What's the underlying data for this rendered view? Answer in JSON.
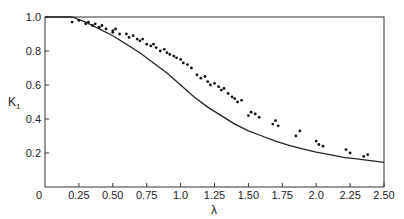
{
  "chart_data": {
    "type": "scatter",
    "title": "",
    "xlabel": "λ",
    "ylabel": "K1",
    "xlim": [
      0,
      2.5
    ],
    "ylim": [
      0,
      1.0
    ],
    "x_ticks": [
      0.25,
      0.5,
      0.75,
      1.0,
      1.25,
      1.5,
      1.75,
      2.0,
      2.25,
      2.5
    ],
    "x_tick_labels": [
      "0.25",
      "0.50",
      "0.75",
      "1.0",
      "1.25",
      "1.50",
      "1.75",
      "2.0",
      "2.25",
      "2.50"
    ],
    "x_origin_label": "0",
    "y_ticks": [
      0.2,
      0.4,
      0.6,
      0.8,
      1.0
    ],
    "y_tick_labels": [
      "0.2",
      "0.4",
      "0.6",
      "0.8",
      "1.0"
    ],
    "grid": false,
    "series": [
      {
        "name": "theory",
        "kind": "line",
        "x": [
          0,
          0.2,
          0.3,
          0.4,
          0.5,
          0.6,
          0.7,
          0.8,
          0.9,
          1.0,
          1.1,
          1.2,
          1.3,
          1.4,
          1.5,
          1.6,
          1.7,
          1.8,
          1.9,
          2.0,
          2.1,
          2.2,
          2.3,
          2.4,
          2.5
        ],
        "y": [
          1.0,
          1.0,
          0.97,
          0.93,
          0.89,
          0.84,
          0.79,
          0.73,
          0.67,
          0.6,
          0.53,
          0.47,
          0.42,
          0.37,
          0.33,
          0.3,
          0.27,
          0.245,
          0.225,
          0.205,
          0.19,
          0.175,
          0.165,
          0.155,
          0.145
        ]
      },
      {
        "name": "measured",
        "kind": "points",
        "x": [
          0.2,
          0.25,
          0.3,
          0.32,
          0.35,
          0.37,
          0.4,
          0.42,
          0.45,
          0.5,
          0.52,
          0.5,
          0.55,
          0.6,
          0.62,
          0.65,
          0.68,
          0.7,
          0.72,
          0.75,
          0.78,
          0.8,
          0.82,
          0.85,
          0.88,
          0.9,
          0.92,
          0.95,
          0.97,
          1.0,
          1.02,
          1.05,
          1.08,
          1.12,
          1.15,
          1.18,
          1.2,
          1.22,
          1.25,
          1.28,
          1.3,
          1.32,
          1.35,
          1.38,
          1.4,
          1.42,
          1.45,
          1.5,
          1.52,
          1.55,
          1.58,
          1.68,
          1.7,
          1.72,
          1.85,
          1.88,
          2.0,
          2.02,
          2.05,
          2.22,
          2.25,
          2.35,
          2.38
        ],
        "y": [
          0.97,
          0.98,
          0.96,
          0.97,
          0.95,
          0.96,
          0.94,
          0.95,
          0.93,
          0.92,
          0.93,
          0.91,
          0.9,
          0.9,
          0.88,
          0.89,
          0.87,
          0.86,
          0.87,
          0.84,
          0.83,
          0.84,
          0.82,
          0.8,
          0.81,
          0.79,
          0.78,
          0.77,
          0.76,
          0.75,
          0.73,
          0.72,
          0.7,
          0.66,
          0.64,
          0.65,
          0.62,
          0.6,
          0.61,
          0.59,
          0.57,
          0.58,
          0.55,
          0.53,
          0.52,
          0.5,
          0.51,
          0.42,
          0.44,
          0.43,
          0.41,
          0.37,
          0.39,
          0.36,
          0.3,
          0.33,
          0.27,
          0.25,
          0.24,
          0.22,
          0.2,
          0.18,
          0.19
        ]
      }
    ]
  }
}
